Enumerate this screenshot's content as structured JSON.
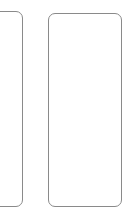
{
  "canvas": {
    "width": 133,
    "height": 217,
    "background_color": "#ffffff"
  },
  "style": {
    "stroke_color": "#8a8a8a",
    "stroke_width_px": 1,
    "corner_radius_px": 7,
    "fill_color": "#ffffff"
  },
  "shapes": [
    {
      "name": "left-panel",
      "kind": "rounded-rectangle",
      "clipped_by_viewport": true,
      "x": -14,
      "y": 11,
      "width": 37,
      "height": 196,
      "label": "",
      "content": ""
    },
    {
      "name": "right-panel",
      "kind": "rounded-rectangle",
      "clipped_by_viewport": false,
      "x": 48,
      "y": 13,
      "width": 74,
      "height": 194,
      "label": "",
      "content": ""
    }
  ]
}
